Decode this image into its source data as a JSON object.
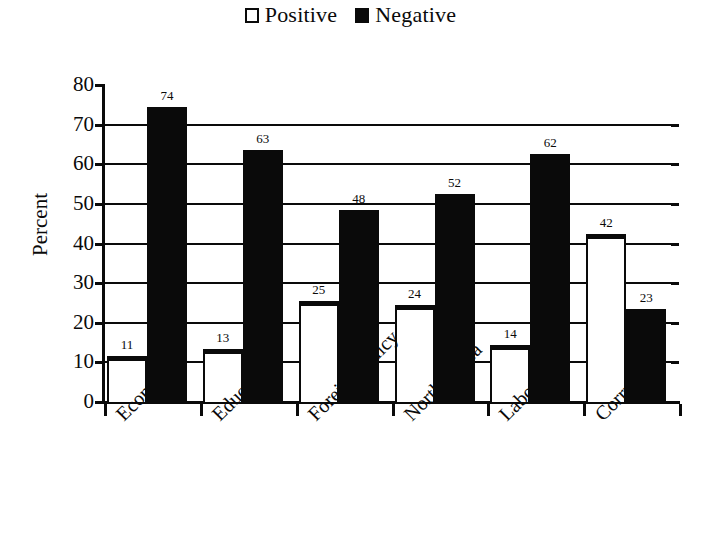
{
  "legend": {
    "entries": [
      {
        "label": "Positive",
        "swatch": "hollow-square-icon",
        "color": "#ffffff"
      },
      {
        "label": "Negative",
        "swatch": "filled-square-icon",
        "color": "#0a0a0a"
      }
    ]
  },
  "axis": {
    "y_title": "Percent",
    "y_ticks": [
      "0",
      "10",
      "20",
      "30",
      "40",
      "50",
      "60",
      "70",
      "80"
    ]
  },
  "chart_data": {
    "type": "bar",
    "title": "",
    "xlabel": "",
    "ylabel": "Percent",
    "ylim": [
      0,
      80
    ],
    "ytick_step": 10,
    "grid": true,
    "legend_position": "top-center",
    "categories": [
      "Economy",
      "Education",
      "Foreign Policy",
      "North Korea",
      "Labor",
      "Corruption"
    ],
    "series": [
      {
        "name": "Positive",
        "color": "#ffffff",
        "values": [
          11,
          13,
          25,
          24,
          14,
          42
        ]
      },
      {
        "name": "Negative",
        "color": "#0a0a0a",
        "values": [
          74,
          63,
          48,
          52,
          62,
          23
        ]
      }
    ]
  }
}
